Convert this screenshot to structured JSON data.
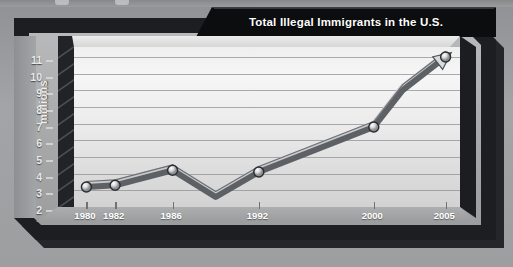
{
  "chart_data": {
    "type": "line",
    "title": "Total Illegal Immigrants in the U.S.",
    "xlabel": "",
    "ylabel": "millions",
    "x": [
      1980,
      1982,
      1986,
      1989,
      1992,
      2000,
      2002,
      2005
    ],
    "values": [
      3.2,
      3.3,
      4.2,
      2.6,
      4.1,
      6.8,
      9.0,
      11.0
    ],
    "marked_points": [
      {
        "x": 1980,
        "y": 3.2
      },
      {
        "x": 1982,
        "y": 3.3
      },
      {
        "x": 1986,
        "y": 4.2
      },
      {
        "x": 1992,
        "y": 4.1
      },
      {
        "x": 2000,
        "y": 6.8
      },
      {
        "x": 2005,
        "y": 11.0
      }
    ],
    "xtick_labels": [
      "1980",
      "1982",
      "1986",
      "1992",
      "2000",
      "2005"
    ],
    "xtick_values": [
      1980,
      1982,
      1986,
      1992,
      2000,
      2005
    ],
    "ytick_labels": [
      "11",
      "10",
      "9",
      "8",
      "7",
      "6",
      "5",
      "4",
      "3",
      "2"
    ],
    "ytick_values": [
      11,
      10,
      9,
      8,
      7,
      6,
      5,
      4,
      3,
      2
    ],
    "xlim": [
      1979,
      2006
    ],
    "ylim": [
      2,
      11.6
    ],
    "grid": true,
    "legend": false,
    "series_name": "Total illegal immigrants",
    "arrow_terminus": true
  },
  "colors": {
    "title_bar": "#0c0d0f",
    "title_text": "#ffffff",
    "frame": "#1c1e21",
    "panel_background": "#a6a8aa",
    "plot_background": "#eaeaea",
    "gridline": "#8e9093",
    "line_dark": "#5d6064",
    "line_light": "#c8cacc",
    "marker_fill": "#d6d8da",
    "marker_stroke": "#2a2c2f",
    "axis_text": "#efefef"
  }
}
